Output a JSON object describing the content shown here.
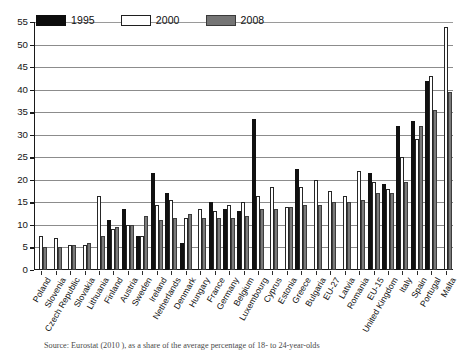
{
  "figure": {
    "caption": "Source: Eurostat (2010 ), as a share of the average percentage of 18- to 24-year-olds"
  },
  "legend": {
    "position": "top-left",
    "items": [
      {
        "label": "1995",
        "color": "#0d0d0d",
        "key": "1995"
      },
      {
        "label": "2000",
        "color": "#ffffff",
        "key": "2000"
      },
      {
        "label": "2008",
        "color": "#757575",
        "key": "2008"
      }
    ]
  },
  "axis": {
    "y_ticks": [
      "0",
      "5",
      "10",
      "15",
      "20",
      "25",
      "30",
      "35",
      "40",
      "45",
      "50",
      "55"
    ]
  },
  "chart_data": {
    "type": "bar",
    "title": "",
    "subtitle": "",
    "xlabel": "",
    "ylabel": "",
    "ylim": [
      0,
      55
    ],
    "ytick_step": 5,
    "grid": true,
    "legend_position": "top-left",
    "categories": [
      "Poland",
      "Slovenia",
      "Czech Republic",
      "Slovakia",
      "Lithuania",
      "Finland",
      "Austria",
      "Sweden",
      "Ireland",
      "Netherlands",
      "Denmark",
      "Hungary",
      "France",
      "Germany",
      "Belgium",
      "Luxembourg",
      "Cyprus",
      "Estonia",
      "Greece",
      "Bulgaria",
      "EU-27",
      "Latvia",
      "Romania",
      "EU-15",
      "United Kingdom",
      "Italy",
      "Spain",
      "Portugal",
      "Malta"
    ],
    "series": [
      {
        "name": "1995",
        "color": "#0d0d0d",
        "values": [
          null,
          null,
          null,
          null,
          null,
          11.0,
          13.5,
          7.5,
          21.5,
          17.0,
          6.0,
          null,
          15.0,
          13.5,
          13.0,
          33.5,
          null,
          null,
          22.5,
          null,
          null,
          null,
          null,
          21.5,
          19.0,
          32.0,
          33.0,
          42.0,
          null
        ]
      },
      {
        "name": "2000",
        "color": "#ffffff",
        "values": [
          7.5,
          7.0,
          5.5,
          5.5,
          16.5,
          9.0,
          10.0,
          7.5,
          14.5,
          15.5,
          11.5,
          13.5,
          13.0,
          14.5,
          15.0,
          16.5,
          18.5,
          14.0,
          18.5,
          20.0,
          17.5,
          16.5,
          22.0,
          19.5,
          18.0,
          25.0,
          29.0,
          43.0,
          54.0
        ]
      },
      {
        "name": "2008",
        "color": "#757575",
        "values": [
          5.0,
          5.0,
          5.5,
          6.0,
          7.5,
          9.5,
          10.0,
          12.0,
          11.0,
          11.5,
          12.5,
          11.5,
          11.5,
          11.5,
          12.0,
          13.5,
          13.5,
          14.0,
          14.5,
          14.5,
          15.0,
          15.0,
          15.5,
          17.0,
          17.0,
          19.5,
          32.0,
          35.5,
          39.5
        ]
      }
    ]
  }
}
